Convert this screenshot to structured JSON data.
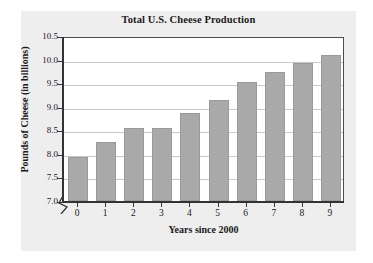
{
  "chart_data": {
    "type": "bar",
    "title": "Total U.S. Cheese Production",
    "xlabel": "Years since 2000",
    "ylabel": "Pounds of Cheese (in billions)",
    "categories": [
      "0",
      "1",
      "2",
      "3",
      "4",
      "5",
      "6",
      "7",
      "8",
      "9"
    ],
    "values": [
      7.93,
      8.25,
      8.54,
      8.55,
      8.86,
      9.15,
      9.52,
      9.73,
      9.92,
      10.09
    ],
    "ylim": [
      7.0,
      10.5
    ],
    "yticks": [
      "7.0",
      "7.5",
      "8.0",
      "8.5",
      "9.0",
      "9.5",
      "10.0",
      "10.5"
    ],
    "ytick_values": [
      7.0,
      7.5,
      8.0,
      8.5,
      9.0,
      9.5,
      10.0,
      10.5
    ],
    "xticks": [
      "0",
      "1",
      "2",
      "3",
      "4",
      "5",
      "6",
      "7",
      "8",
      "9"
    ],
    "grid": true,
    "legend": false,
    "axis_break": true,
    "bar_color": "#a9a9a9",
    "grid_color": "#c9c9c9",
    "panel_color": "#eeeeee",
    "plot_bg_color": "#ffffff",
    "axis_color": "#333333",
    "text_color": "#1a1a1a"
  }
}
